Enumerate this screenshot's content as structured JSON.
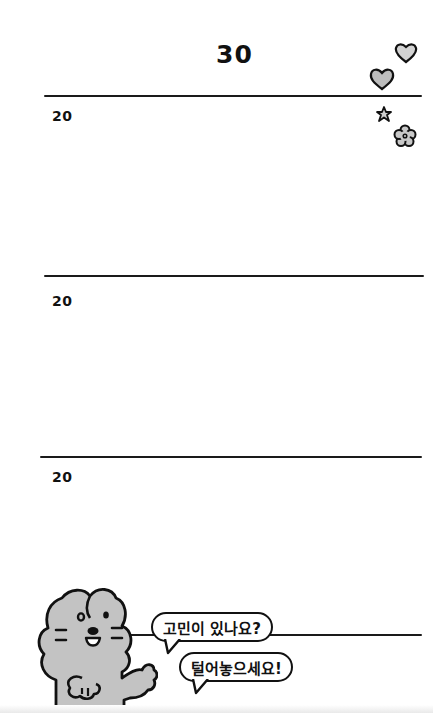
{
  "page": {
    "title": "30",
    "sections": [
      {
        "label": "20"
      },
      {
        "label": "20"
      },
      {
        "label": "20"
      }
    ]
  },
  "character": {
    "name": "gray bunny",
    "speech": [
      {
        "text": "고민이 있나요?"
      },
      {
        "text": "털어놓으세요!"
      }
    ]
  },
  "decorations": [
    "heart-outline",
    "heart-filled",
    "star",
    "flower"
  ],
  "colors": {
    "background": "#ffffff",
    "ink": "#111111",
    "fill_gray": "#c4c4c4"
  }
}
